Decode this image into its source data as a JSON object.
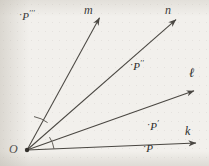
{
  "figure": {
    "kind": "geometry-diagram",
    "background_color": "#f2f0ec",
    "ink_color": "#4a4742"
  },
  "vertex": {
    "label": "O",
    "x": 27,
    "y": 150
  },
  "rays": [
    {
      "id": "ray-k",
      "label": "k",
      "label_x": 186,
      "label_y": 131,
      "from": [
        27,
        150
      ],
      "to": [
        198,
        143
      ],
      "arrowhead": true
    },
    {
      "id": "ray-l",
      "label": "ℓ",
      "label_x": 190,
      "label_y": 72,
      "from": [
        27,
        150
      ],
      "to": [
        196,
        90
      ],
      "arrowhead": true
    },
    {
      "id": "ray-n",
      "label": "n",
      "label_x": 166,
      "label_y": 9,
      "from": [
        27,
        150
      ],
      "to": [
        178,
        18
      ],
      "arrowhead": true
    },
    {
      "id": "ray-m",
      "label": "m",
      "label_x": 85,
      "label_y": 9,
      "from": [
        27,
        150
      ],
      "to": [
        101,
        16
      ],
      "arrowhead": true
    }
  ],
  "points": [
    {
      "id": "point-P",
      "label": "P",
      "primes": "",
      "x": 146,
      "y": 148,
      "dot": true
    },
    {
      "id": "point-P-prime",
      "label": "P",
      "primes": "′",
      "x": 150,
      "y": 126,
      "dot": true
    },
    {
      "id": "point-P-double-prime",
      "label": "P",
      "primes": "′′",
      "x": 133,
      "y": 66,
      "dot": true
    },
    {
      "id": "point-P-triple-prime",
      "label": "P",
      "primes": "′′′",
      "x": 22,
      "y": 16,
      "dot": true
    }
  ],
  "angle_marks": [
    {
      "id": "angle-arc-lower",
      "description": "arc between ray k and ray l near vertex",
      "radius": 27
    },
    {
      "id": "angle-arc-upper",
      "description": "arc between ray n and ray m near vertex",
      "radius": 34
    }
  ]
}
